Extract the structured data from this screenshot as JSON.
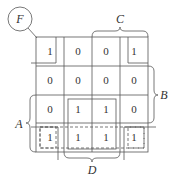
{
  "title": "F",
  "labels": {
    "A": "A",
    "B": "B",
    "C": "C",
    "D": "D"
  },
  "grid": [
    [
      "1",
      "0",
      "0",
      "1"
    ],
    [
      "0",
      "0",
      "0",
      "0"
    ],
    [
      "0",
      "1",
      "1",
      "0"
    ],
    [
      "1",
      "1",
      "1",
      "1"
    ]
  ],
  "colors": {
    "line": "#555555",
    "text": "#333333",
    "background": "#ffffff"
  }
}
